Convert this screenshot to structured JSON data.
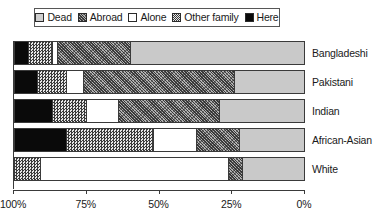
{
  "legend": {
    "position": "top",
    "items": [
      {
        "label": "Dead",
        "key": "dead",
        "swatch": "light-gray-square-icon",
        "color": "#c9c9c9"
      },
      {
        "label": "Abroad",
        "key": "abroad",
        "swatch": "dark-hatch-square-icon",
        "color": "#8a8a8a"
      },
      {
        "label": "Alone",
        "key": "alone",
        "swatch": "white-square-icon",
        "color": "#ffffff"
      },
      {
        "label": "Other family",
        "key": "other",
        "swatch": "checkered-square-icon",
        "color": "#b0b0b0"
      },
      {
        "label": "Here",
        "key": "here",
        "swatch": "black-square-icon",
        "color": "#0a0a0a"
      }
    ]
  },
  "axis": {
    "ticks": [
      {
        "label": "100%",
        "value": 100
      },
      {
        "label": "75%",
        "value": 75
      },
      {
        "label": "50%",
        "value": 50
      },
      {
        "label": "25%",
        "value": 25
      },
      {
        "label": "0%",
        "value": 0
      }
    ],
    "reversed": true
  },
  "chart_data": {
    "type": "bar",
    "orientation": "horizontal",
    "stacked": true,
    "stack_total": 100,
    "title": "",
    "xlabel": "",
    "ylabel": "",
    "xlim": [
      100,
      0
    ],
    "grid": false,
    "legend_position": "top",
    "categories": [
      "Bangladeshi",
      "Pakistani",
      "Indian",
      "African-Asian",
      "White"
    ],
    "series": [
      {
        "name": "Here",
        "key": "here",
        "values": [
          5,
          8,
          13,
          18,
          0
        ]
      },
      {
        "name": "Other family",
        "key": "other",
        "values": [
          8,
          10,
          12,
          30,
          9
        ]
      },
      {
        "name": "Alone",
        "key": "alone",
        "values": [
          2,
          6,
          11,
          15,
          65
        ]
      },
      {
        "name": "Abroad",
        "key": "abroad",
        "values": [
          25,
          52,
          35,
          15,
          5
        ]
      },
      {
        "name": "Dead",
        "key": "dead",
        "values": [
          60,
          24,
          29,
          22,
          21
        ]
      }
    ],
    "bars": [
      {
        "category": "Bangladeshi",
        "segments": [
          {
            "key": "here",
            "label": "Here",
            "value": 5
          },
          {
            "key": "other",
            "label": "Other family",
            "value": 8
          },
          {
            "key": "alone",
            "label": "Alone",
            "value": 2
          },
          {
            "key": "abroad",
            "label": "Abroad",
            "value": 25
          },
          {
            "key": "dead",
            "label": "Dead",
            "value": 60
          }
        ]
      },
      {
        "category": "Pakistani",
        "segments": [
          {
            "key": "here",
            "label": "Here",
            "value": 8
          },
          {
            "key": "other",
            "label": "Other family",
            "value": 10
          },
          {
            "key": "alone",
            "label": "Alone",
            "value": 6
          },
          {
            "key": "abroad",
            "label": "Abroad",
            "value": 52
          },
          {
            "key": "dead",
            "label": "Dead",
            "value": 24
          }
        ]
      },
      {
        "category": "Indian",
        "segments": [
          {
            "key": "here",
            "label": "Here",
            "value": 13
          },
          {
            "key": "other",
            "label": "Other family",
            "value": 12
          },
          {
            "key": "alone",
            "label": "Alone",
            "value": 11
          },
          {
            "key": "abroad",
            "label": "Abroad",
            "value": 35
          },
          {
            "key": "dead",
            "label": "Dead",
            "value": 29
          }
        ]
      },
      {
        "category": "African-Asian",
        "segments": [
          {
            "key": "here",
            "label": "Here",
            "value": 18
          },
          {
            "key": "other",
            "label": "Other family",
            "value": 30
          },
          {
            "key": "alone",
            "label": "Alone",
            "value": 15
          },
          {
            "key": "abroad",
            "label": "Abroad",
            "value": 15
          },
          {
            "key": "dead",
            "label": "Dead",
            "value": 22
          }
        ]
      },
      {
        "category": "White",
        "segments": [
          {
            "key": "other",
            "label": "Other family",
            "value": 9
          },
          {
            "key": "alone",
            "label": "Alone",
            "value": 65
          },
          {
            "key": "abroad",
            "label": "Abroad",
            "value": 5
          },
          {
            "key": "dead",
            "label": "Dead",
            "value": 21
          }
        ]
      }
    ]
  }
}
